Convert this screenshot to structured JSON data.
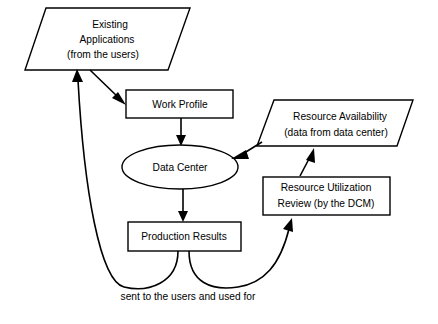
{
  "diagram": {
    "background_color": "#ffffff",
    "line_color": "#000000",
    "nodes": [
      {
        "id": "existing-applications",
        "shape": "parallelogram",
        "lines": [
          "Existing",
          "Applications",
          "(from the users)"
        ],
        "line1": "Existing",
        "line2": "Applications",
        "line3": "(from the users)"
      },
      {
        "id": "work-profile",
        "shape": "rectangle",
        "line1": "Work Profile"
      },
      {
        "id": "data-center",
        "shape": "ellipse",
        "line1": "Data Center"
      },
      {
        "id": "production-results",
        "shape": "rectangle",
        "line1": "Production Results"
      },
      {
        "id": "resource-availability",
        "shape": "parallelogram",
        "line1": "Resource Availability",
        "line2": "(data from data center)"
      },
      {
        "id": "resource-utilization-review",
        "shape": "rectangle",
        "line1": "Resource Utilization",
        "line2": "Review (by the DCM)"
      }
    ],
    "caption": "sent to the users and used for",
    "edges": [
      {
        "id": "apps-to-work-profile",
        "from": "existing-applications",
        "to": "work-profile",
        "style": "straight-arrow"
      },
      {
        "id": "work-profile-to-data-center",
        "from": "work-profile",
        "to": "data-center",
        "style": "straight-arrow"
      },
      {
        "id": "data-center-to-production-results",
        "from": "data-center",
        "to": "production-results",
        "style": "straight-arrow"
      },
      {
        "id": "resource-availability-to-data-center",
        "from": "resource-availability",
        "to": "data-center",
        "style": "straight-arrow"
      },
      {
        "id": "review-to-resource-availability",
        "from": "resource-utilization-review",
        "to": "resource-availability",
        "style": "straight-arrow"
      },
      {
        "id": "production-results-to-apps",
        "from": "production-results",
        "to": "existing-applications",
        "style": "curved-arrow"
      },
      {
        "id": "production-results-to-review",
        "from": "production-results",
        "to": "resource-utilization-review",
        "style": "curved-arrow"
      }
    ]
  }
}
